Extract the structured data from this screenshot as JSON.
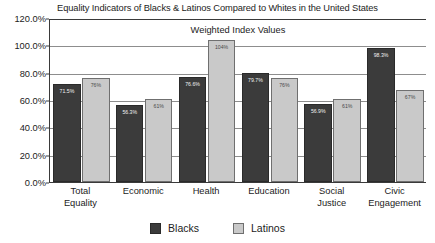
{
  "chart_data": {
    "type": "bar",
    "title": "Equality Indicators of Blacks & Latinos Compared to Whites in the United States",
    "inner_title": "Weighted Index Values",
    "xlabel": "",
    "ylabel": "",
    "ylim": [
      0,
      120
    ],
    "ytick_values": [
      0,
      20,
      40,
      60,
      80,
      100,
      120
    ],
    "ytick_labels": [
      "0.0%",
      "20.0%",
      "40.0%",
      "60.0%",
      "80.0%",
      "100.0%",
      "120.0%"
    ],
    "grid": true,
    "legend_position": "bottom",
    "categories": [
      "Total Equality",
      "Economic",
      "Health",
      "Education",
      "Social Justice",
      "Civic Engagement"
    ],
    "category_lines": [
      [
        "Total",
        "Equality"
      ],
      [
        "Economic",
        ""
      ],
      [
        "Health",
        ""
      ],
      [
        "Education",
        ""
      ],
      [
        "Social",
        "Justice"
      ],
      [
        "Civic",
        "Engagement"
      ]
    ],
    "series": [
      {
        "name": "Blacks",
        "color": "#3b3b3b",
        "values": [
          71.5,
          56.3,
          76.6,
          79.7,
          56.9,
          98.3
        ],
        "labels": [
          "71.5%",
          "56.3%",
          "76.6%",
          "79.7%",
          "56.9%",
          "98.3%"
        ]
      },
      {
        "name": "Latinos",
        "color": "#c9c9c9",
        "values": [
          76,
          61,
          104,
          76,
          61,
          67
        ],
        "labels": [
          "76%",
          "61%",
          "104%",
          "76%",
          "61%",
          "67%"
        ]
      }
    ]
  }
}
